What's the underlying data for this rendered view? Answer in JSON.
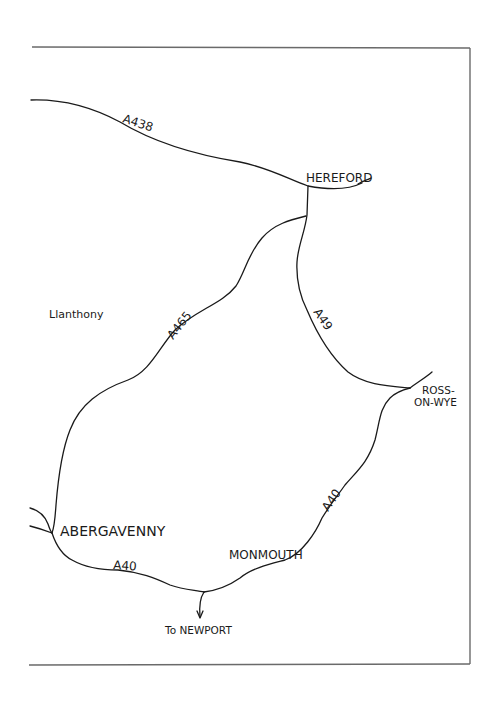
{
  "map": {
    "towns": {
      "hereford": "HEREFORD",
      "ross_line1": "ROSS-",
      "ross_line2": "ON-WYE",
      "abergavenny": "ABERGAVENNY",
      "monmouth": "MONMOUTH",
      "llanthony": "Llanthony",
      "to_newport": "To NEWPORT"
    },
    "roads": {
      "a438": "A438",
      "a465": "A465",
      "a49": "A49",
      "a40_east": "A40",
      "a40_south": "A40"
    },
    "colors": {
      "ink": "#1a1a1a",
      "frame": "#6a6a6a",
      "paper": "#ffffff"
    }
  }
}
